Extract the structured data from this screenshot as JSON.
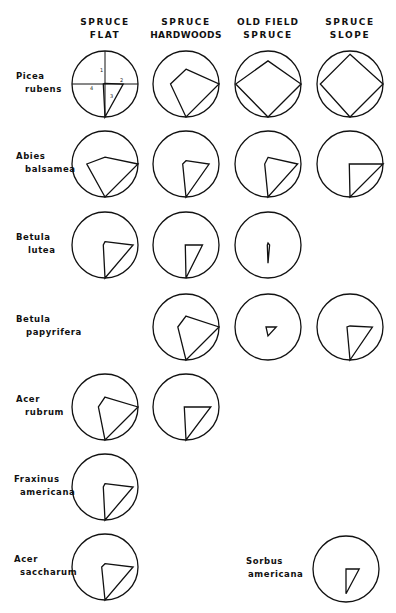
{
  "diagram": {
    "type": "polar-quadrant-diagrams",
    "columns": [
      {
        "id": "spruce-flat",
        "line1": "SPRUCE",
        "line2": "FLAT",
        "cx": 105
      },
      {
        "id": "spruce-hardwoods",
        "line1": "SPRUCE",
        "line2": "HARDWOODS",
        "cx": 186
      },
      {
        "id": "old-field-spruce",
        "line1": "OLD FIELD",
        "line2": "SPRUCE",
        "cx": 268
      },
      {
        "id": "spruce-slope",
        "line1": "SPRUCE",
        "line2": "SLOPE",
        "cx": 350
      }
    ],
    "key_circle_labels": {
      "top": "1",
      "right": "2",
      "bottom": "3",
      "left": "4"
    },
    "radius": 33,
    "rows": [
      {
        "genus": "Picea",
        "species": "rubens",
        "cy": 84,
        "label_x": 16,
        "cells": [
          {
            "col": 0,
            "key": true,
            "n": 0.02,
            "e": 0.55,
            "s": 1.0,
            "w": 0.05
          },
          {
            "col": 1,
            "n": 0.45,
            "e": 1.0,
            "s": 1.0,
            "w": 0.47
          },
          {
            "col": 2,
            "n": 0.7,
            "e": 1.0,
            "s": 1.0,
            "w": 0.98
          },
          {
            "col": 3,
            "n": 0.9,
            "e": 1.0,
            "s": 1.0,
            "w": 0.9
          }
        ]
      },
      {
        "genus": "Abies",
        "species": "balsamea",
        "cy": 164,
        "label_x": 16,
        "cells": [
          {
            "col": 0,
            "n": 0.21,
            "e": 1.0,
            "s": 1.0,
            "w": 0.55
          },
          {
            "col": 1,
            "n": 0.1,
            "e": 0.7,
            "s": 1.0,
            "w": 0.1
          },
          {
            "col": 2,
            "n": 0.2,
            "e": 0.9,
            "s": 1.0,
            "w": 0.1
          },
          {
            "col": 3,
            "n": 0.0,
            "e": 1.0,
            "s": 1.0,
            "w": 0.02
          }
        ]
      },
      {
        "genus": "Betula",
        "species": "lutea",
        "cy": 245,
        "label_x": 16,
        "cells": [
          {
            "col": 0,
            "n": 0.1,
            "e": 0.85,
            "s": 1.0,
            "w": 0.05
          },
          {
            "col": 1,
            "n": 0.0,
            "e": 0.5,
            "s": 1.0,
            "w": 0.02
          },
          {
            "col": 2,
            "n": 0.06,
            "e": 0.05,
            "s": 0.55,
            "w": 0.02
          }
        ]
      },
      {
        "genus": "Betula",
        "species": "papyrifera",
        "cy": 327,
        "label_x": 16,
        "cells": [
          {
            "col": 1,
            "n": 0.33,
            "e": 1.0,
            "s": 1.0,
            "w": 0.25
          },
          {
            "col": 2,
            "n": 0.0,
            "e": 0.25,
            "s": 0.27,
            "w": 0.06
          },
          {
            "col": 3,
            "n": 0.03,
            "e": 0.68,
            "s": 1.0,
            "w": 0.09
          }
        ]
      },
      {
        "genus": "Acer",
        "species": "rubrum",
        "cy": 407,
        "label_x": 16,
        "cells": [
          {
            "col": 0,
            "n": 0.3,
            "e": 1.0,
            "s": 1.0,
            "w": 0.2
          },
          {
            "col": 1,
            "n": 0.0,
            "e": 0.75,
            "s": 1.0,
            "w": 0.05
          }
        ]
      },
      {
        "genus": "Fraxinus",
        "species": "americana",
        "cy": 487,
        "label_x": 14,
        "cells": [
          {
            "col": 0,
            "n": 0.1,
            "e": 0.85,
            "s": 1.0,
            "w": 0.05
          }
        ]
      },
      {
        "genus": "Acer",
        "species": "saccharum",
        "cy": 567,
        "label_x": 14,
        "cells": [
          {
            "col": 0,
            "n": 0.1,
            "e": 0.85,
            "s": 1.0,
            "w": 0.1
          }
        ]
      }
    ],
    "extra": [
      {
        "genus": "Sorbus",
        "species": "americana",
        "cx": 346,
        "cy": 569,
        "label_x": 246,
        "n": 0.0,
        "e": 0.4,
        "s": 0.75,
        "w": 0.0
      }
    ]
  }
}
